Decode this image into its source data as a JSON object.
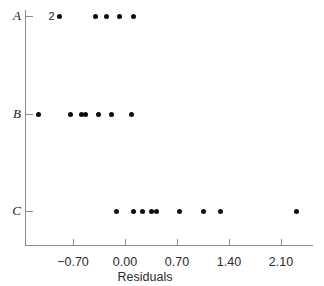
{
  "chart_data": {
    "type": "scatter",
    "title": "",
    "xlabel": "Residuals",
    "ylabel": "",
    "grid": false,
    "legend": null,
    "xlim": [
      -1.3,
      2.52
    ],
    "xticks": [
      -0.7,
      0.0,
      0.7,
      1.4,
      2.1
    ],
    "xticklabels": [
      "−0.70",
      "0.00",
      "0.70",
      "1.40",
      "2.10"
    ],
    "categories": [
      "A",
      "B",
      "C"
    ],
    "groups": [
      {
        "name": "A",
        "values": [
          -0.88,
          -0.88,
          -0.4,
          -0.25,
          -0.07,
          0.11
        ],
        "annotations": [
          {
            "text": "2",
            "value": -0.88,
            "meaning": "two overlapping points"
          }
        ]
      },
      {
        "name": "B",
        "values": [
          -1.17,
          -0.73,
          -0.58,
          -0.53,
          -0.36,
          -0.18,
          0.09
        ]
      },
      {
        "name": "C",
        "values": [
          -0.11,
          0.11,
          0.24,
          0.36,
          0.42,
          0.74,
          1.06,
          1.29,
          2.31
        ]
      }
    ],
    "point_color": "#0d0d0d",
    "axis_color": "#8c8c8c"
  }
}
